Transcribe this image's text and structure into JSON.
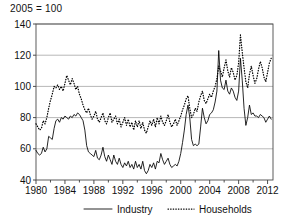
{
  "chart_data": {
    "type": "line",
    "title": "2005 = 100",
    "xlabel": "",
    "ylabel": "",
    "xlim": [
      1980,
      2012.75
    ],
    "ylim": [
      40,
      140
    ],
    "yticks": [
      40,
      60,
      80,
      100,
      120,
      140
    ],
    "xticks_major": [
      1980,
      1984,
      1988,
      1992,
      1996,
      2000,
      2004,
      2008,
      2012
    ],
    "xticks_minor": [
      1982,
      1986,
      1990,
      1994,
      1998,
      2002,
      2006,
      2010
    ],
    "grid": "horizontal",
    "legend_position": "bottom",
    "series": [
      {
        "name": "Industry",
        "style": "solid",
        "color": "#000000",
        "x": [
          1980.0,
          1980.25,
          1980.5,
          1980.75,
          1981.0,
          1981.25,
          1981.5,
          1981.75,
          1982.0,
          1982.25,
          1982.5,
          1982.75,
          1983.0,
          1983.25,
          1983.5,
          1983.75,
          1984.0,
          1984.25,
          1984.5,
          1984.75,
          1985.0,
          1985.25,
          1985.5,
          1985.75,
          1986.0,
          1986.25,
          1986.5,
          1986.75,
          1987.0,
          1987.25,
          1987.5,
          1987.75,
          1988.0,
          1988.25,
          1988.5,
          1988.75,
          1989.0,
          1989.25,
          1989.5,
          1989.75,
          1990.0,
          1990.25,
          1990.5,
          1990.75,
          1991.0,
          1991.25,
          1991.5,
          1991.75,
          1992.0,
          1992.25,
          1992.5,
          1992.75,
          1993.0,
          1993.25,
          1993.5,
          1993.75,
          1994.0,
          1994.25,
          1994.5,
          1994.75,
          1995.0,
          1995.25,
          1995.5,
          1995.75,
          1996.0,
          1996.25,
          1996.5,
          1996.75,
          1997.0,
          1997.25,
          1997.5,
          1997.75,
          1998.0,
          1998.25,
          1998.5,
          1998.75,
          1999.0,
          1999.25,
          1999.5,
          1999.75,
          2000.0,
          2000.25,
          2000.5,
          2000.75,
          2001.0,
          2001.25,
          2001.5,
          2001.75,
          2002.0,
          2002.25,
          2002.5,
          2002.75,
          2003.0,
          2003.25,
          2003.5,
          2003.75,
          2004.0,
          2004.25,
          2004.5,
          2004.75,
          2005.0,
          2005.25,
          2005.5,
          2005.75,
          2006.0,
          2006.25,
          2006.5,
          2006.75,
          2007.0,
          2007.25,
          2007.5,
          2007.75,
          2008.0,
          2008.25,
          2008.5,
          2008.75,
          2009.0,
          2009.25,
          2009.5,
          2009.75,
          2010.0,
          2010.25,
          2010.5,
          2010.75,
          2011.0,
          2011.25,
          2011.5,
          2011.75,
          2012.0,
          2012.25,
          2012.5
        ],
        "values": [
          59,
          57,
          56,
          57,
          61,
          58,
          60,
          68,
          67,
          66,
          73,
          78,
          79,
          77,
          80,
          79,
          81,
          80,
          79,
          81,
          80,
          82,
          81,
          83,
          82,
          80,
          78,
          72,
          62,
          58,
          57,
          56,
          55,
          59,
          54,
          53,
          56,
          61,
          55,
          52,
          56,
          53,
          50,
          56,
          52,
          50,
          54,
          50,
          48,
          51,
          49,
          52,
          48,
          50,
          47,
          52,
          48,
          50,
          47,
          52,
          46,
          44,
          46,
          50,
          48,
          51,
          47,
          52,
          51,
          57,
          53,
          50,
          52,
          54,
          50,
          48,
          49,
          50,
          49,
          52,
          57,
          64,
          72,
          82,
          88,
          80,
          66,
          62,
          63,
          62,
          63,
          74,
          86,
          80,
          76,
          78,
          82,
          83,
          85,
          90,
          97,
          123,
          104,
          99,
          98,
          104,
          97,
          95,
          99,
          97,
          93,
          91,
          97,
          118,
          104,
          86,
          75,
          80,
          88,
          82,
          83,
          81,
          81,
          80,
          82,
          81,
          80,
          77,
          79,
          81,
          79
        ]
      },
      {
        "name": "Households",
        "style": "dotted",
        "color": "#000000",
        "x": [
          1980.0,
          1980.25,
          1980.5,
          1980.75,
          1981.0,
          1981.25,
          1981.5,
          1981.75,
          1982.0,
          1982.25,
          1982.5,
          1982.75,
          1983.0,
          1983.25,
          1983.5,
          1983.75,
          1984.0,
          1984.25,
          1984.5,
          1984.75,
          1985.0,
          1985.25,
          1985.5,
          1985.75,
          1986.0,
          1986.25,
          1986.5,
          1986.75,
          1987.0,
          1987.25,
          1987.5,
          1987.75,
          1988.0,
          1988.25,
          1988.5,
          1988.75,
          1989.0,
          1989.25,
          1989.5,
          1989.75,
          1990.0,
          1990.25,
          1990.5,
          1990.75,
          1991.0,
          1991.25,
          1991.5,
          1991.75,
          1992.0,
          1992.25,
          1992.5,
          1992.75,
          1993.0,
          1993.25,
          1993.5,
          1993.75,
          1994.0,
          1994.25,
          1994.5,
          1994.75,
          1995.0,
          1995.25,
          1995.5,
          1995.75,
          1996.0,
          1996.25,
          1996.5,
          1996.75,
          1997.0,
          1997.25,
          1997.5,
          1997.75,
          1998.0,
          1998.25,
          1998.5,
          1998.75,
          1999.0,
          1999.25,
          1999.5,
          1999.75,
          2000.0,
          2000.25,
          2000.5,
          2000.75,
          2001.0,
          2001.25,
          2001.5,
          2001.75,
          2002.0,
          2002.25,
          2002.5,
          2002.75,
          2003.0,
          2003.25,
          2003.5,
          2003.75,
          2004.0,
          2004.25,
          2004.5,
          2004.75,
          2005.0,
          2005.25,
          2005.5,
          2005.75,
          2006.0,
          2006.25,
          2006.5,
          2006.75,
          2007.0,
          2007.25,
          2007.5,
          2007.75,
          2008.0,
          2008.25,
          2008.5,
          2008.75,
          2009.0,
          2009.25,
          2009.5,
          2009.75,
          2010.0,
          2010.25,
          2010.5,
          2010.75,
          2011.0,
          2011.25,
          2011.5,
          2011.75,
          2012.0,
          2012.25,
          2012.5
        ],
        "values": [
          76,
          74,
          72,
          73,
          78,
          76,
          80,
          86,
          91,
          95,
          100,
          99,
          101,
          98,
          100,
          97,
          102,
          107,
          104,
          101,
          105,
          102,
          98,
          100,
          95,
          92,
          88,
          85,
          83,
          86,
          82,
          79,
          81,
          84,
          79,
          77,
          80,
          83,
          78,
          76,
          80,
          83,
          77,
          79,
          81,
          76,
          79,
          74,
          77,
          80,
          75,
          79,
          74,
          77,
          72,
          78,
          74,
          78,
          73,
          77,
          72,
          70,
          74,
          78,
          75,
          79,
          74,
          80,
          76,
          81,
          77,
          75,
          78,
          82,
          77,
          74,
          76,
          79,
          75,
          78,
          81,
          85,
          88,
          92,
          94,
          86,
          80,
          82,
          86,
          84,
          90,
          94,
          97,
          91,
          89,
          92,
          95,
          93,
          97,
          100,
          105,
          113,
          110,
          106,
          112,
          117,
          110,
          106,
          112,
          109,
          104,
          107,
          115,
          133,
          122,
          112,
          103,
          99,
          108,
          113,
          107,
          102,
          105,
          111,
          116,
          112,
          106,
          103,
          109,
          115,
          118
        ]
      }
    ]
  },
  "legend": {
    "items": [
      {
        "label": "Industry",
        "style": "solid"
      },
      {
        "label": "Households",
        "style": "dotted"
      }
    ]
  }
}
